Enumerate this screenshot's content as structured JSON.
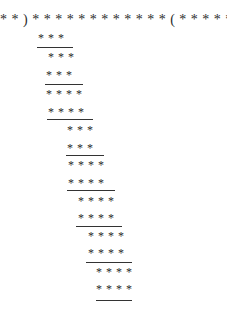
{
  "page": {
    "cut_off_text": "· · · —————— · ·",
    "rows": [
      {
        "text": "* * ) * * * * * * * * * * * * ( * * * * * * * *"
      },
      {
        "text": "* * *"
      },
      {
        "text": "* * *"
      },
      {
        "text": "* * *"
      },
      {
        "text": "* * * *"
      },
      {
        "text": "* * * *"
      },
      {
        "text": "* * *"
      },
      {
        "text": "* * *"
      },
      {
        "text": "* * * *"
      },
      {
        "text": "* * * *"
      },
      {
        "text": "* * * *"
      },
      {
        "text": "* * * *"
      },
      {
        "text": "* * * *"
      },
      {
        "text": "* * * *"
      },
      {
        "text": "* * * *"
      },
      {
        "text": "* * * *"
      }
    ]
  }
}
